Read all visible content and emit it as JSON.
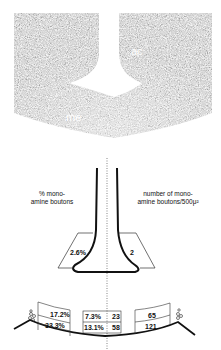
{
  "micrograph": {
    "labels": {
      "ventricle": "V",
      "ac": "ac",
      "me": "me"
    }
  },
  "diagram": {
    "left_caption_line1": "% mono-",
    "left_caption_line2": "amine boutons",
    "right_caption_line1": "number of mono-",
    "right_caption_line2": "amine boutons/500μ²",
    "upper_left_value": "2.6%",
    "upper_right_value": "2",
    "lower_left_top": "17.2%",
    "lower_left_bottom": "33.3%",
    "lower_mid_left_top": "7.3%",
    "lower_mid_left_bottom": "13.1%",
    "lower_mid_right_top": "23",
    "lower_mid_right_bottom": "58",
    "lower_right_top": "65",
    "lower_right_bottom": "121"
  },
  "colors": {
    "ink": "#111111",
    "background": "#ffffff"
  }
}
